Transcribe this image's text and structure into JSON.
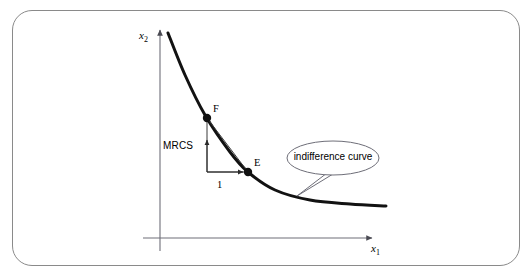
{
  "figure": {
    "title": "",
    "frame": {
      "border_color": "#8a8a8a",
      "background": "#ffffff",
      "corner_radius": 20
    }
  },
  "axes": {
    "x_label": "x",
    "x_sub": "1",
    "y_label": "x",
    "y_sub": "2",
    "color": "#6e6e78",
    "origin": {
      "x": 160,
      "y": 238
    },
    "x_end": {
      "x": 372,
      "y": 238
    },
    "y_top": {
      "x": 160,
      "y": 30
    }
  },
  "curve": {
    "name": "indifference-curve",
    "color": "#121212",
    "width": 3.0,
    "points": [
      {
        "x": 168,
        "y": 33
      },
      {
        "x": 185,
        "y": 75
      },
      {
        "x": 205,
        "y": 115
      },
      {
        "x": 230,
        "y": 152
      },
      {
        "x": 248,
        "y": 172
      },
      {
        "x": 275,
        "y": 190
      },
      {
        "x": 310,
        "y": 200
      },
      {
        "x": 350,
        "y": 204
      },
      {
        "x": 386,
        "y": 206
      }
    ]
  },
  "points": [
    {
      "id": "F",
      "label": "F",
      "x": 207,
      "y": 118,
      "label_x": 213,
      "label_y": 106
    },
    {
      "id": "E",
      "label": "E",
      "x": 248,
      "y": 172,
      "label_x": 254,
      "label_y": 160
    }
  ],
  "chord": {
    "name": "chord-F-E",
    "from": "F",
    "to": "E",
    "color": "#3a3a3a",
    "width": 1.0
  },
  "annotations": {
    "mrcs": {
      "label": "MRCS",
      "label_x": 163,
      "label_y": 145,
      "arrow_from": {
        "x": 207,
        "y": 172
      },
      "arrow_to": {
        "x": 207,
        "y": 140
      },
      "color": "#3a3a3a"
    },
    "unit_step": {
      "label": "1",
      "label_x": 217,
      "label_y": 186,
      "arrow_from": {
        "x": 207,
        "y": 172
      },
      "arrow_to": {
        "x": 243,
        "y": 172
      },
      "color": "#3a3a3a"
    }
  },
  "callout": {
    "text": "indifference curve",
    "center_x": 333,
    "center_y": 158,
    "rx": 46,
    "ry": 17,
    "border_color": "#6e6e78",
    "fill": "#ffffff",
    "tail_tip": {
      "x": 297,
      "y": 196
    },
    "tail_base_a": {
      "x": 327,
      "y": 173
    },
    "tail_base_b": {
      "x": 333,
      "y": 174
    }
  }
}
